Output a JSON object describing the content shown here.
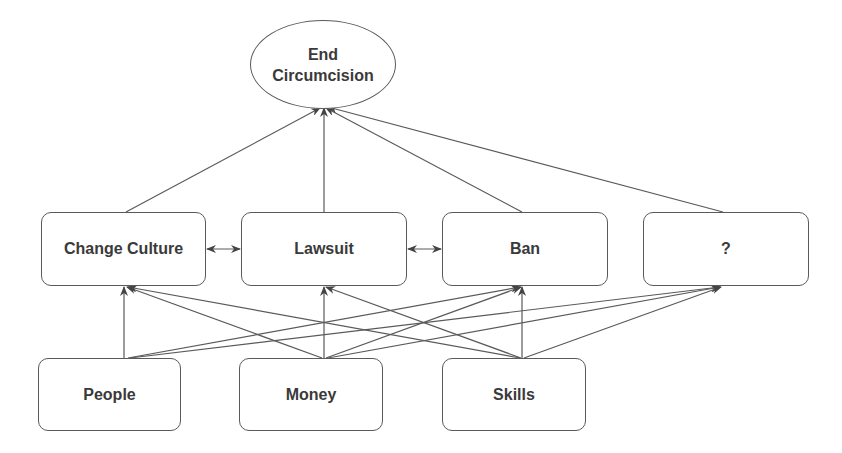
{
  "goal": {
    "line1": "End",
    "line2": "Circumcision"
  },
  "strategies": [
    {
      "id": "change-culture",
      "label": "Change Culture"
    },
    {
      "id": "lawsuit",
      "label": "Lawsuit"
    },
    {
      "id": "ban",
      "label": "Ban"
    },
    {
      "id": "unknown",
      "label": "?"
    }
  ],
  "resources": [
    {
      "id": "people",
      "label": "People"
    },
    {
      "id": "money",
      "label": "Money"
    },
    {
      "id": "skills",
      "label": "Skills"
    }
  ],
  "edges": {
    "strategy_to_goal": [
      "change-culture",
      "lawsuit",
      "ban",
      "unknown"
    ],
    "bidirectional": [
      [
        "change-culture",
        "lawsuit"
      ],
      [
        "lawsuit",
        "ban"
      ]
    ],
    "resource_to_strategy": {
      "people": [
        "change-culture",
        "ban",
        "unknown"
      ],
      "money": [
        "change-culture",
        "lawsuit",
        "ban",
        "unknown"
      ],
      "skills": [
        "change-culture",
        "lawsuit",
        "ban",
        "unknown"
      ]
    }
  },
  "colors": {
    "stroke": "#5a5a5a",
    "text": "#3a3a3a",
    "background": "#ffffff"
  }
}
